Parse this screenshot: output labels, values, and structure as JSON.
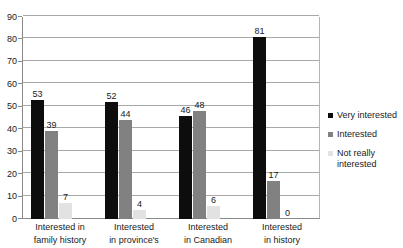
{
  "chart_data": {
    "type": "bar",
    "title": "",
    "subtitle": "",
    "xlabel": "",
    "ylabel": "",
    "ylim": [
      0,
      90
    ],
    "ytick_step": 10,
    "yticks": [
      0,
      10,
      20,
      30,
      40,
      50,
      60,
      70,
      80,
      90
    ],
    "grid": true,
    "legend_position": "right",
    "categories": [
      "Interested in family history",
      "Interested in province's",
      "Interested in Canadian",
      "Interested in history"
    ],
    "category_lines": [
      [
        "Interested in",
        "family history"
      ],
      [
        "Interested",
        "in province's"
      ],
      [
        "Interested",
        "in Canadian"
      ],
      [
        "Interested",
        "in history"
      ]
    ],
    "series": [
      {
        "name": "Very interested",
        "color": "#0d0d0d",
        "values": [
          53,
          52,
          46,
          81
        ]
      },
      {
        "name": "Interested",
        "color": "#818181",
        "values": [
          39,
          44,
          48,
          17
        ]
      },
      {
        "name": "Not really interested",
        "color": "#e2e2e2",
        "values": [
          7,
          4,
          6,
          0
        ]
      }
    ]
  },
  "legend": {
    "items": [
      {
        "label": "Very interested",
        "color": "#0d0d0d"
      },
      {
        "label": "Interested",
        "color": "#818181"
      },
      {
        "label_line1": "Not really",
        "label_line2": "interested",
        "color": "#e2e2e2"
      }
    ]
  },
  "axis": {
    "y_tick_labels": [
      "0",
      "10",
      "20",
      "30",
      "40",
      "50",
      "60",
      "70",
      "80",
      "90"
    ]
  }
}
